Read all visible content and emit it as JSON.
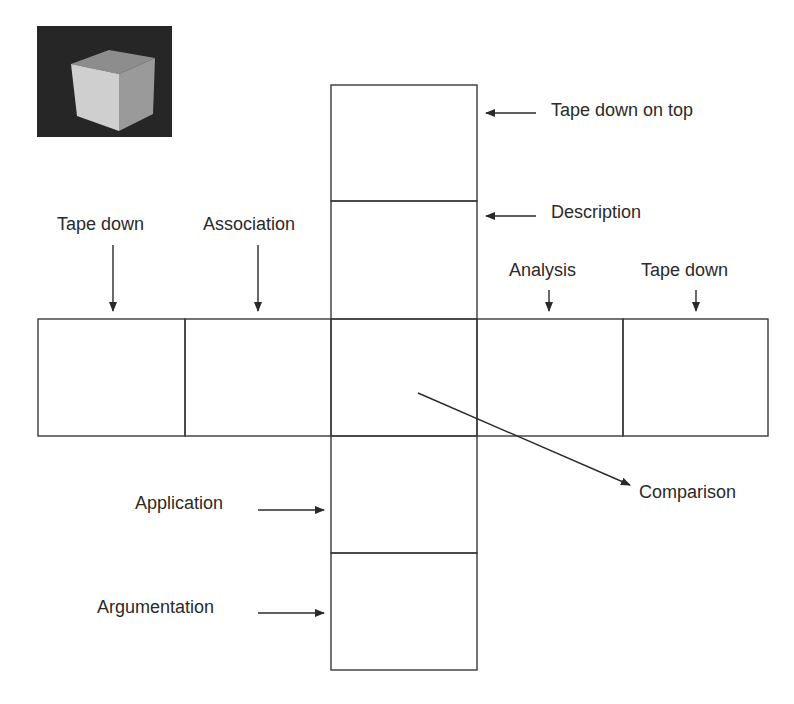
{
  "diagram": {
    "type": "cube-net",
    "thumbnail": {
      "icon": "cube-photo",
      "alt": "3D cube"
    },
    "labels": {
      "tape_down_on_top": "Tape down on top",
      "description": "Description",
      "tape_down_left": "Tape down",
      "association": "Association",
      "analysis": "Analysis",
      "tape_down_right": "Tape down",
      "comparison": "Comparison",
      "application": "Application",
      "argumentation": "Argumentation"
    },
    "colors": {
      "line": "#3a3a3a",
      "text": "#2a2a2a",
      "background": "#ffffff",
      "photo_bg": "#262626"
    }
  }
}
